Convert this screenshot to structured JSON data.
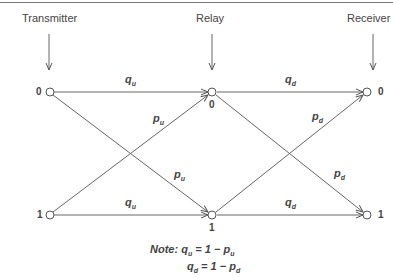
{
  "stages": [
    {
      "label": "Transmitter",
      "x": 49
    },
    {
      "label": "Relay",
      "x": 212
    },
    {
      "label": "Receiver",
      "x": 367
    }
  ],
  "nodes": {
    "transmitter_0": "0",
    "transmitter_1": "1",
    "relay_0": "0",
    "relay_1": "1",
    "receiver_0": "0",
    "receiver_1": "1"
  },
  "edges": {
    "uplink_straight_top": {
      "sym": "q",
      "sub": "u"
    },
    "uplink_straight_bottom": {
      "sym": "q",
      "sub": "u"
    },
    "uplink_cross_up": {
      "sym": "p",
      "sub": "u"
    },
    "uplink_cross_down": {
      "sym": "p",
      "sub": "u"
    },
    "downlink_straight_top": {
      "sym": "q",
      "sub": "d"
    },
    "downlink_straight_bottom": {
      "sym": "q",
      "sub": "d"
    },
    "downlink_cross_up": {
      "sym": "p",
      "sub": "d"
    },
    "downlink_cross_down": {
      "sym": "p",
      "sub": "d"
    }
  },
  "note": {
    "prefix": "Note:",
    "line1": {
      "lhs": "q",
      "lhs_sub": "u",
      "eq": " = 1 − ",
      "rhs": "p",
      "rhs_sub": "u"
    },
    "line2": {
      "lhs": "q",
      "lhs_sub": "d",
      "eq": " = 1 − ",
      "rhs": "p",
      "rhs_sub": "d"
    }
  },
  "colors": {
    "line": "#555555",
    "text": "#444444"
  }
}
